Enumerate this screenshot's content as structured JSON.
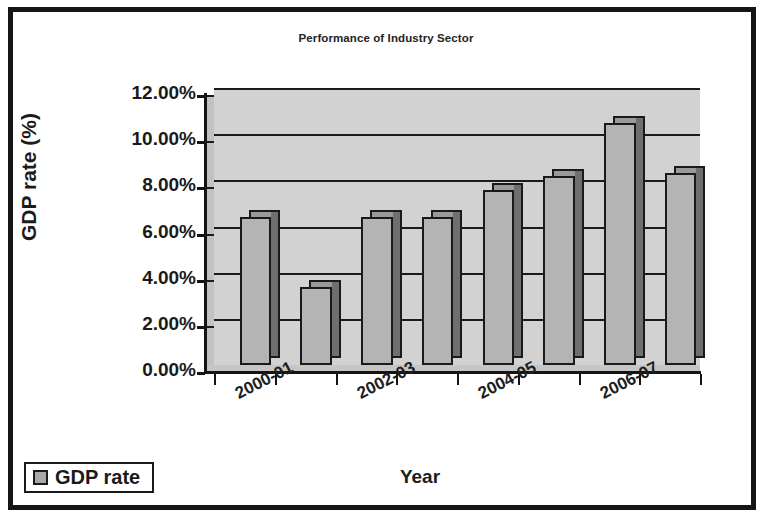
{
  "chart_data": {
    "type": "bar",
    "title": "Performance of Industry Sector",
    "xlabel": "Year",
    "ylabel": "GDP rate (%)",
    "categories": [
      "2000-01",
      "2001-02",
      "2002-03",
      "2003-04",
      "2004-05",
      "2005-06",
      "2006-07",
      "2007-08"
    ],
    "visible_tick_labels": [
      "2000-01",
      "2002-03",
      "2004-05",
      "2006-07"
    ],
    "series": [
      {
        "name": "GDP rate",
        "values": [
          6.4,
          3.4,
          6.4,
          6.4,
          7.6,
          8.2,
          10.5,
          8.3
        ]
      }
    ],
    "ylim": [
      0,
      12
    ],
    "ytick_labels": [
      "0.00%",
      "2.00%",
      "4.00%",
      "6.00%",
      "8.00%",
      "10.00%",
      "12.00%"
    ],
    "ytick_values": [
      0,
      2,
      4,
      6,
      8,
      10,
      12
    ],
    "grid": true,
    "legend_position": "bottom-left",
    "style_3d": true,
    "colors": {
      "bar_front": "#b4b4b4",
      "bar_side": "#6f6f6f",
      "bar_top": "#9a9a9a",
      "plot_background": "#d2d2d2",
      "axis": "#141414",
      "frame": "#151515"
    }
  },
  "legend": {
    "entries": [
      {
        "label": "GDP rate",
        "swatch_color": "#a8a8a8"
      }
    ]
  }
}
